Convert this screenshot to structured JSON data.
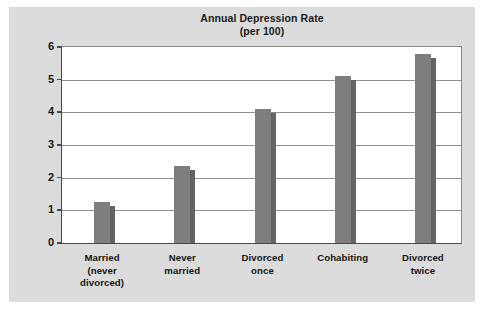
{
  "chart_data": {
    "type": "bar",
    "title": "Annual Depression Rate",
    "subtitle": "(per 100)",
    "xlabel": "",
    "ylabel": "",
    "ylim": [
      0,
      6
    ],
    "ytick_step": 1,
    "ytick_labels": [
      "6",
      "5",
      "4",
      "3",
      "2",
      "1",
      "0"
    ],
    "grid": true,
    "legend": "none",
    "bar_color": "#7e7e7e",
    "bar_shadow_color": "#646464",
    "plot_background": "#ffffff",
    "panel_background": "#dcdcdc",
    "categories": [
      "Married (never divorced)",
      "Never married",
      "Divorced once",
      "Cohabiting",
      "Divorced twice"
    ],
    "category_lines": [
      [
        "Married",
        "(never",
        "divorced)"
      ],
      [
        "Never",
        "married"
      ],
      [
        "Divorced",
        "once"
      ],
      [
        "Cohabiting"
      ],
      [
        "Divorced",
        "twice"
      ]
    ],
    "values": [
      1.25,
      2.35,
      4.1,
      5.1,
      5.8
    ]
  }
}
